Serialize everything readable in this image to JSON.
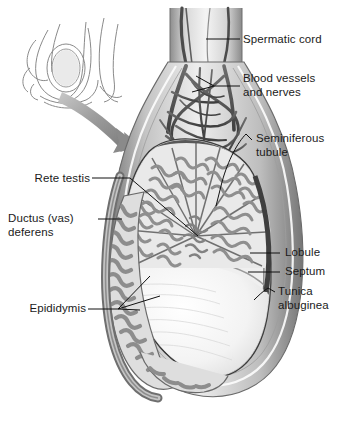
{
  "figure": {
    "background_color": "#ffffff",
    "label_color": "#1b1b1b",
    "leader_color": "#111111",
    "palette": {
      "outline": "#555555",
      "dark_capsule": "#4a4a4a",
      "mid_gray": "#8d8d8d",
      "light_gray": "#c9c9c9",
      "pale": "#ebebeb",
      "tubule_fill": "#9a9a9a",
      "white_surface": "#f7f7f7",
      "arrow_gray": "#9b9b9b"
    }
  },
  "inset": {
    "name": "scrotum-in-situ-inset",
    "description": "Small line drawing of the scrotum and testis in position on the body"
  },
  "arrow": {
    "name": "magnify-arrow",
    "description": "Curved gray arrow pointing from the inset to the enlarged testis"
  },
  "labels": [
    {
      "id": "spermatic-cord",
      "text": "Spermatic cord",
      "side": "right",
      "x": 243,
      "y": 33,
      "leader": "dash"
    },
    {
      "id": "blood-vessels",
      "text": "Blood vessels\nand nerves",
      "side": "right",
      "x": 243,
      "y": 77,
      "leader": "dash-fork"
    },
    {
      "id": "seminiferous",
      "text": "Seminiferous\ntubule",
      "side": "right",
      "x": 255,
      "y": 132,
      "leader": "hook"
    },
    {
      "id": "lobule",
      "text": "Lobule",
      "side": "right",
      "x": 283,
      "y": 247,
      "leader": "dash"
    },
    {
      "id": "septum",
      "text": "Septum",
      "side": "right",
      "x": 283,
      "y": 266,
      "leader": "dash"
    },
    {
      "id": "tunica-albuginea",
      "text": "Tunica\nalbuginea",
      "side": "right",
      "x": 277,
      "y": 285,
      "leader": "hook"
    },
    {
      "id": "rete-testis",
      "text": "Rete testis",
      "side": "left",
      "x": 14,
      "y": 172,
      "leader": "dash"
    },
    {
      "id": "ductus-deferens",
      "text": "Ductus (vas)\ndeferens",
      "side": "left",
      "x": 12,
      "y": 213,
      "leader": "dash"
    },
    {
      "id": "epididymis",
      "text": "Epididymis",
      "side": "left",
      "x": 17,
      "y": 303,
      "leader": "fan"
    }
  ]
}
